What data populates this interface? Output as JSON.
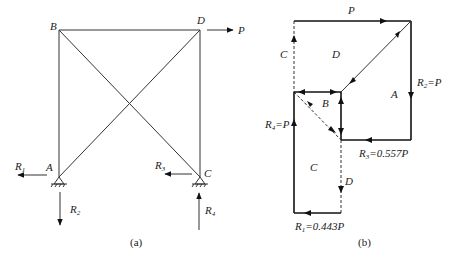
{
  "figure_a": {
    "caption": "(a)",
    "joints": {
      "A": "A",
      "B": "B",
      "C": "C",
      "D": "D"
    },
    "loads": {
      "P": "P"
    },
    "reactions": {
      "R1": {
        "base": "R",
        "sub": "1"
      },
      "R2": {
        "base": "R",
        "sub": "2"
      },
      "R3": {
        "base": "R",
        "sub": "3"
      },
      "R4": {
        "base": "R",
        "sub": "4"
      }
    }
  },
  "figure_b": {
    "caption": "(b)",
    "top_label": "P",
    "region_labels": {
      "C_top": "C",
      "D_top": "D",
      "A": "A",
      "B": "B",
      "C_bottom": "C",
      "D_bottom": "D"
    },
    "force_labels": {
      "R2": {
        "base": "R",
        "sub": "2",
        "value": "=P"
      },
      "R4": {
        "base": "R",
        "sub": "4",
        "value": "=P"
      },
      "R3": {
        "base": "R",
        "sub": "3",
        "value": "=0.557P"
      },
      "R1": {
        "base": "R",
        "sub": "1",
        "value": "=0.443P"
      }
    }
  }
}
